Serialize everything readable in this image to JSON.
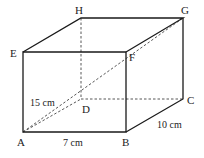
{
  "diagram": {
    "type": "rectangular-prism",
    "vertices": {
      "A": {
        "label": "A"
      },
      "B": {
        "label": "B"
      },
      "C": {
        "label": "C"
      },
      "D": {
        "label": "D"
      },
      "E": {
        "label": "E"
      },
      "F": {
        "label": "F"
      },
      "G": {
        "label": "G"
      },
      "H": {
        "label": "H"
      }
    },
    "dimensions": {
      "length": "7 cm",
      "width": "10 cm",
      "height": "15 cm"
    },
    "hidden_edges": [
      "AD",
      "DC",
      "DH"
    ],
    "diagonal": "AG"
  }
}
